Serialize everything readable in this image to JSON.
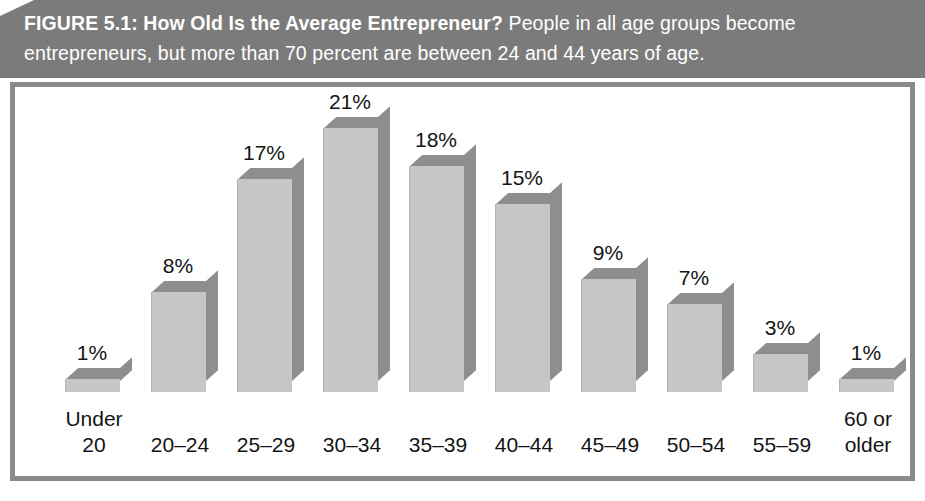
{
  "caption": {
    "lead": "FIGURE 5.1: How Old Is the Average Entrepreneur?",
    "body": " People in all age groups become entrepreneurs, but more than 70 percent are between 24 and 44 years of age."
  },
  "colors": {
    "banner_background": "#7b7b7b",
    "banner_text": "#ffffff",
    "frame_border": "#8a8a8a",
    "plot_background": "#ffffff",
    "bar_front": "#c6c6c6",
    "bar_shade": "#8e8e8e",
    "label_text": "#141414"
  },
  "chart_data": {
    "type": "bar",
    "title": "FIGURE 5.1: How Old Is the Average Entrepreneur?",
    "subtitle": "People in all age groups become entrepreneurs, but more than 70 percent are between 24 and 44 years of age.",
    "xlabel": "",
    "ylabel": "",
    "ylim": [
      0,
      22
    ],
    "grid": false,
    "legend": "none",
    "categories": [
      "Under 20",
      "20–24",
      "25–29",
      "30–34",
      "35–39",
      "40–44",
      "45–49",
      "50–54",
      "55–59",
      "60 or older"
    ],
    "values": [
      1,
      8,
      17,
      21,
      18,
      15,
      9,
      7,
      3,
      1
    ],
    "value_labels": [
      "1%",
      "8%",
      "17%",
      "21%",
      "18%",
      "15%",
      "9%",
      "7%",
      "3%",
      "1%"
    ],
    "tick_labels": [
      [
        "Under",
        "20"
      ],
      [
        "20–24"
      ],
      [
        "25–29"
      ],
      [
        "30–34"
      ],
      [
        "35–39"
      ],
      [
        "40–44"
      ],
      [
        "45–49"
      ],
      [
        "50–54"
      ],
      [
        "55–59"
      ],
      [
        "60 or",
        "older"
      ]
    ]
  }
}
